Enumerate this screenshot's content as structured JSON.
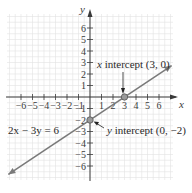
{
  "chart_data": {
    "type": "line",
    "title": "",
    "xlabel": "x",
    "ylabel": "y",
    "xlim": [
      -7,
      7
    ],
    "ylim": [
      -7,
      7
    ],
    "grid": true,
    "x_ticks": [
      -6,
      -5,
      -4,
      -3,
      -2,
      -1,
      1,
      2,
      3,
      4,
      5,
      6
    ],
    "y_ticks": [
      6,
      5,
      4,
      3,
      2,
      1,
      -1,
      -2,
      -3,
      -4,
      -5,
      -6
    ],
    "x_tick_labels": [
      "−6",
      "−5",
      "−4",
      "−3",
      "−2",
      "−1",
      "1",
      "2",
      "3",
      "4",
      "5",
      "6"
    ],
    "y_tick_labels": [
      "6",
      "5",
      "4",
      "3",
      "2",
      "1",
      "−1",
      "−2",
      "−3",
      "−4",
      "−5",
      "−6"
    ],
    "series": [
      {
        "name": "2x − 3y = 6",
        "equation": "2x − 3y = 6",
        "slope": 0.6667,
        "intercept": -2,
        "x": [
          -7.1,
          7.1
        ],
        "y": [
          -6.73,
          2.73
        ]
      }
    ],
    "points": [
      {
        "label": "x intercept (3, 0)",
        "x": 3,
        "y": 0
      },
      {
        "label": "y intercept (0, −2)",
        "x": 0,
        "y": -2
      }
    ],
    "annotations": {
      "equation_label": "2x − 3y = 6",
      "x_intercept_prefix": "x",
      "x_intercept_text": " intercept (3, 0)",
      "y_intercept_prefix": "y",
      "y_intercept_text": " intercept (0, −2)"
    }
  }
}
